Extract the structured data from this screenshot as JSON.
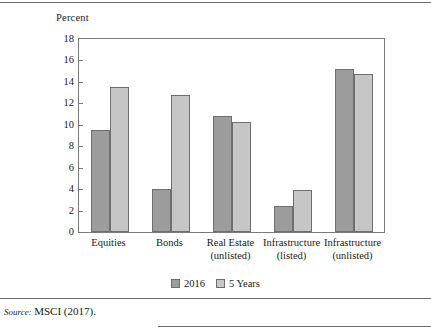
{
  "chart_data": {
    "type": "bar",
    "title": "",
    "subtitle": "",
    "xlabel": "",
    "ylabel": "Percent",
    "ylim": [
      0,
      18
    ],
    "ytick_step": 2,
    "yticks": [
      "18",
      "16",
      "14",
      "12",
      "10",
      "8",
      "6",
      "4",
      "2",
      "0"
    ],
    "grid": false,
    "legend_position": "bottom-center",
    "categories": [
      {
        "line1": "Equities",
        "line2": ""
      },
      {
        "line1": "Bonds",
        "line2": ""
      },
      {
        "line1": "Real Estate",
        "line2": "(unlisted)"
      },
      {
        "line1": "Infrastructure",
        "line2": "(listed)"
      },
      {
        "line1": "Infrastructure",
        "line2": "(unlisted)"
      }
    ],
    "series": [
      {
        "name": "2016",
        "color": "#9c9c9c",
        "values": [
          9.5,
          4.0,
          10.8,
          2.4,
          15.2
        ]
      },
      {
        "name": "5 Years",
        "color": "#c6c6c6",
        "values": [
          13.5,
          12.8,
          10.3,
          3.9,
          14.7
        ]
      }
    ]
  },
  "source": {
    "label": "Source:",
    "text": "MSCI (2017)."
  },
  "colors": {
    "series_2016": "#9c9c9c",
    "series_5years": "#c6c6c6",
    "axis": "#7a7a7a",
    "rule": "#6d6d6d",
    "text": "#1a1a1a"
  }
}
